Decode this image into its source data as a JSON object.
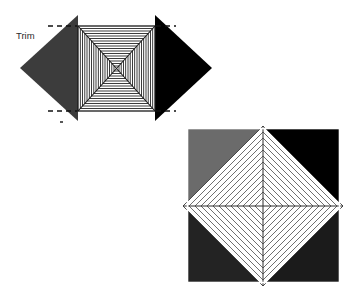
{
  "diagram": {
    "title": "",
    "background_color": "#ffffff",
    "annotations": {
      "trim_label": "Trim"
    },
    "figures": [
      {
        "id": "top-figure",
        "name": "flat-pattern-square-with-side-triangles",
        "center": {
          "x": 116,
          "y": 68
        },
        "square": {
          "left": 78,
          "top": 26,
          "right": 155,
          "bottom": 111,
          "fill_color": "#ffffff",
          "stroke_color": "#1a1a1a",
          "concentric_line_count": 17,
          "diagonals": 2
        },
        "left_triangle": {
          "name": "left-gray-triangle",
          "fill_color": "#3c3c3c",
          "apex": {
            "x": 20,
            "y": 68
          },
          "base_top": {
            "x": 78,
            "y": 15
          },
          "base_bottom": {
            "x": 78,
            "y": 121
          }
        },
        "right_triangle": {
          "name": "right-black-triangle",
          "fill_color": "#000000",
          "apex": {
            "x": 212,
            "y": 68
          },
          "base_top": {
            "x": 155,
            "y": 15
          },
          "base_bottom": {
            "x": 155,
            "y": 121
          }
        },
        "trim_marks": [
          {
            "name": "trim-mark-top-left",
            "x1": 48,
            "y1": 26,
            "x2": 78,
            "y2": 26
          },
          {
            "name": "trim-mark-bottom-left",
            "x1": 48,
            "y1": 111,
            "x2": 78,
            "y2": 111
          },
          {
            "name": "trim-mark-top-right",
            "x1": 155,
            "y1": 26,
            "x2": 176,
            "y2": 26
          },
          {
            "name": "trim-mark-bottom-right",
            "x1": 155,
            "y1": 111,
            "x2": 176,
            "y2": 111
          }
        ],
        "trim_label_position": {
          "x": 16,
          "y": 39
        }
      },
      {
        "id": "bottom-figure",
        "name": "folded-pyramid-square-with-diamond",
        "frame": {
          "left": 187,
          "top": 128,
          "right": 340,
          "bottom": 283,
          "border_color": "#ffffff"
        },
        "quadrants": [
          {
            "name": "quadrant-top-left",
            "fill_color": "#6b6b6b"
          },
          {
            "name": "quadrant-top-right",
            "fill_color": "#000000"
          },
          {
            "name": "quadrant-bottom-left",
            "fill_color": "#232323"
          },
          {
            "name": "quadrant-bottom-right",
            "fill_color": "#1b1b1b"
          }
        ],
        "diamond": {
          "name": "center-white-diamond",
          "fill_color": "#ffffff",
          "stroke_color": "#3a3a3a",
          "center": {
            "x": 263,
            "y": 206
          },
          "half_width": 80,
          "half_height": 80,
          "concentric_line_count": 13,
          "axes": 2
        }
      }
    ],
    "colors": {
      "white": "#ffffff",
      "black": "#000000",
      "gray_mid": "#6b6b6b",
      "gray_dark": "#3c3c3c",
      "gray_darker": "#232323",
      "line": "#1a1a1a"
    }
  }
}
